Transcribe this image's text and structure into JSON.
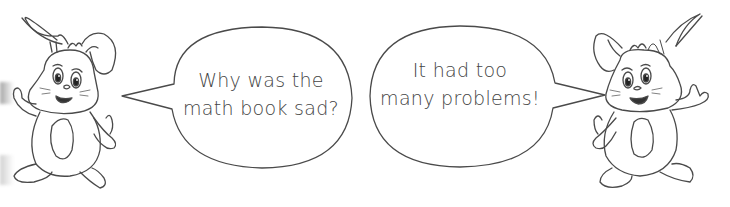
{
  "comic": {
    "left_character": {
      "name": "bunny",
      "facing": "right"
    },
    "right_character": {
      "name": "bunny",
      "facing": "left"
    },
    "left_bubble": {
      "lines": [
        "Why was the",
        "math book sad?"
      ]
    },
    "right_bubble": {
      "lines": [
        "It had too",
        "many problems!"
      ]
    }
  },
  "colors": {
    "line": "#4a4a4a",
    "background": "#ffffff",
    "text": "#444444"
  }
}
